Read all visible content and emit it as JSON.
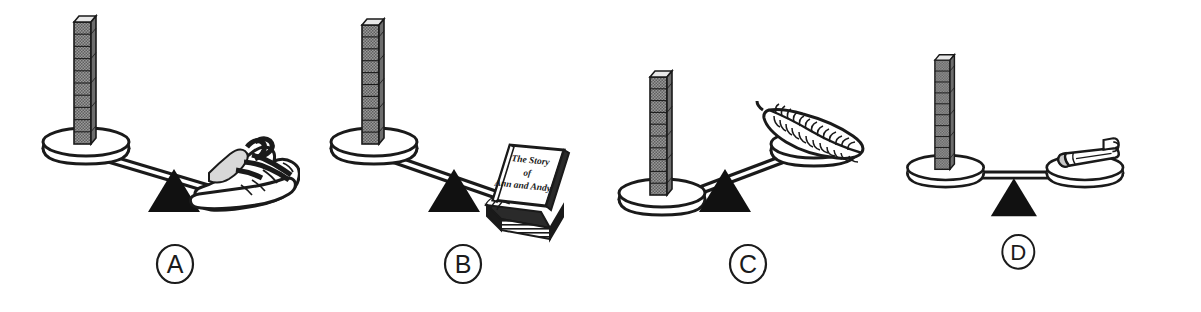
{
  "figure": {
    "background_color": "#ffffff",
    "ink_color": "#1a1a1a",
    "cube_fill_color": "#8a8a8a",
    "fulcrum_color": "#111111",
    "panel_count": 4
  },
  "panels": [
    {
      "label": "A",
      "label_shape": "circle",
      "left_pan": {
        "object": "cube-stack",
        "object_name": "unit cubes",
        "cube_count": 10,
        "position": "up"
      },
      "right_pan": {
        "object": "shoe",
        "object_name": "sneaker",
        "position": "down"
      },
      "beam_state": "tilted-right-down",
      "heavier_side": "right",
      "fulcrum": "triangle"
    },
    {
      "label": "B",
      "label_shape": "circle",
      "left_pan": {
        "object": "cube-stack",
        "object_name": "unit cubes",
        "cube_count": 10,
        "position": "up"
      },
      "right_pan": {
        "object": "book",
        "object_name": "book",
        "position": "down",
        "book_title_lines": [
          "The Story",
          "of",
          "Ann and Andy"
        ]
      },
      "beam_state": "tilted-right-down",
      "heavier_side": "right",
      "fulcrum": "triangle"
    },
    {
      "label": "C",
      "label_shape": "circle",
      "left_pan": {
        "object": "cube-stack",
        "object_name": "unit cubes",
        "cube_count": 10,
        "position": "down"
      },
      "right_pan": {
        "object": "feather",
        "object_name": "feather",
        "position": "up"
      },
      "beam_state": "tilted-left-down",
      "heavier_side": "left",
      "fulcrum": "triangle"
    },
    {
      "label": "D",
      "label_shape": "circle",
      "left_pan": {
        "object": "cube-stack",
        "object_name": "unit cubes",
        "cube_count": 10,
        "position": "level"
      },
      "right_pan": {
        "object": "pencil",
        "object_name": "pencil",
        "position": "level"
      },
      "beam_state": "level",
      "heavier_side": "none",
      "fulcrum": "triangle"
    }
  ]
}
